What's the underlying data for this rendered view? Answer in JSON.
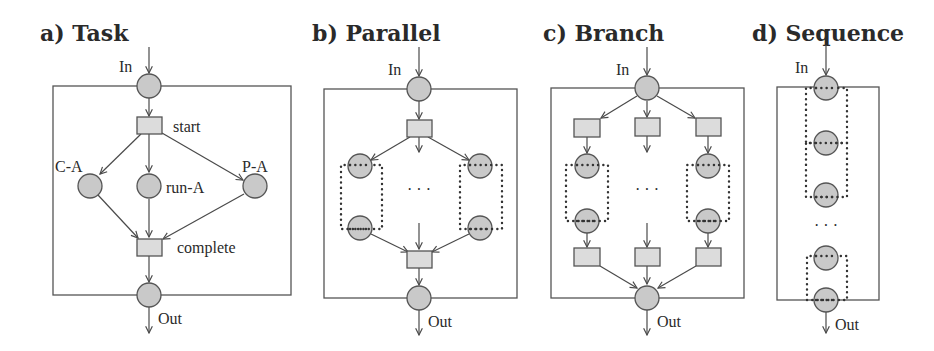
{
  "figure": {
    "panels": [
      {
        "id": "a",
        "title": "a) Task",
        "labels": {
          "in": "In",
          "out": "Out",
          "start": "start",
          "complete": "complete",
          "cancel": "C-A",
          "run": "run-A",
          "pause": "P-A"
        }
      },
      {
        "id": "b",
        "title": "b) Parallel",
        "labels": {
          "in": "In",
          "out": "Out",
          "ellipsis": "· · ·"
        }
      },
      {
        "id": "c",
        "title": "c) Branch",
        "labels": {
          "in": "In",
          "out": "Out",
          "ellipsis": "· · ·"
        }
      },
      {
        "id": "d",
        "title": "d) Sequence",
        "labels": {
          "in": "In",
          "out": "Out",
          "ellipsis": "· · ·"
        }
      }
    ],
    "colors": {
      "place_fill": "#c9c9c9",
      "transition_fill": "#dcdcdc",
      "stroke": "#555555"
    }
  }
}
